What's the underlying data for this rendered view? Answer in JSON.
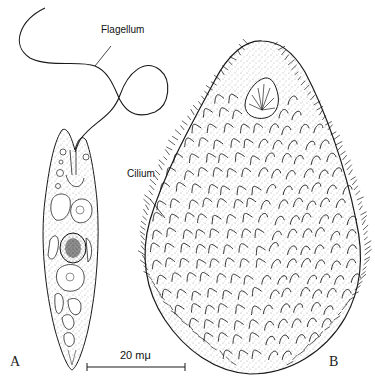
{
  "figure": {
    "panels": [
      {
        "id": "A",
        "label": "A",
        "organism": "flagellate"
      },
      {
        "id": "B",
        "label": "B",
        "organism": "ciliate"
      }
    ],
    "annotations": {
      "flagellum": "Flagellum",
      "cilium": "Cilium"
    },
    "scale_bar": {
      "label": "20 mμ",
      "length_px": 98
    },
    "colors": {
      "ink": "#1a1a1a",
      "stipple": "#555555",
      "background": "#ffffff"
    }
  }
}
